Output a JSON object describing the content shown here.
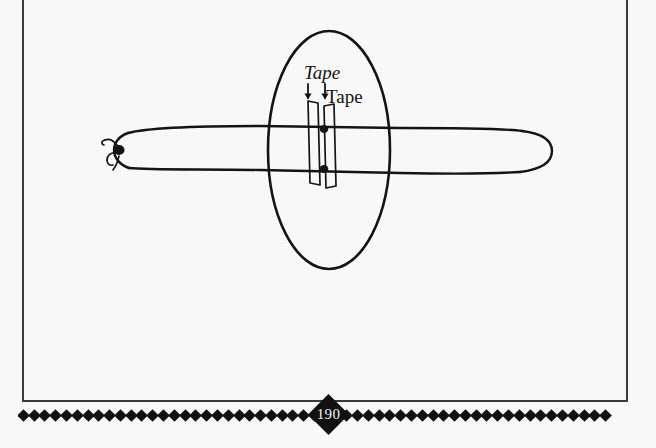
{
  "page": {
    "number": "190",
    "background_color": "#fafafa",
    "frame_color": "#3b3b3b",
    "ink_color": "#141414",
    "ornament_color": "#111111",
    "ornament_count": 55
  },
  "figure": {
    "labels": {
      "tape_italic": "Tape",
      "tape_upright": "Tape"
    },
    "elements": {
      "balloon": "long-balloon-outline",
      "balloon_knot": "tied-knot-left-end",
      "magnifier_ellipse": "detail-ellipse",
      "tape_strip_left": "tape-strip",
      "tape_strip_right": "tape-strip",
      "pin_dot_top": "skewer-puncture-dot",
      "pin_dot_bottom": "skewer-puncture-dot",
      "arrow_left": "down-arrow",
      "arrow_right": "down-arrow"
    }
  }
}
